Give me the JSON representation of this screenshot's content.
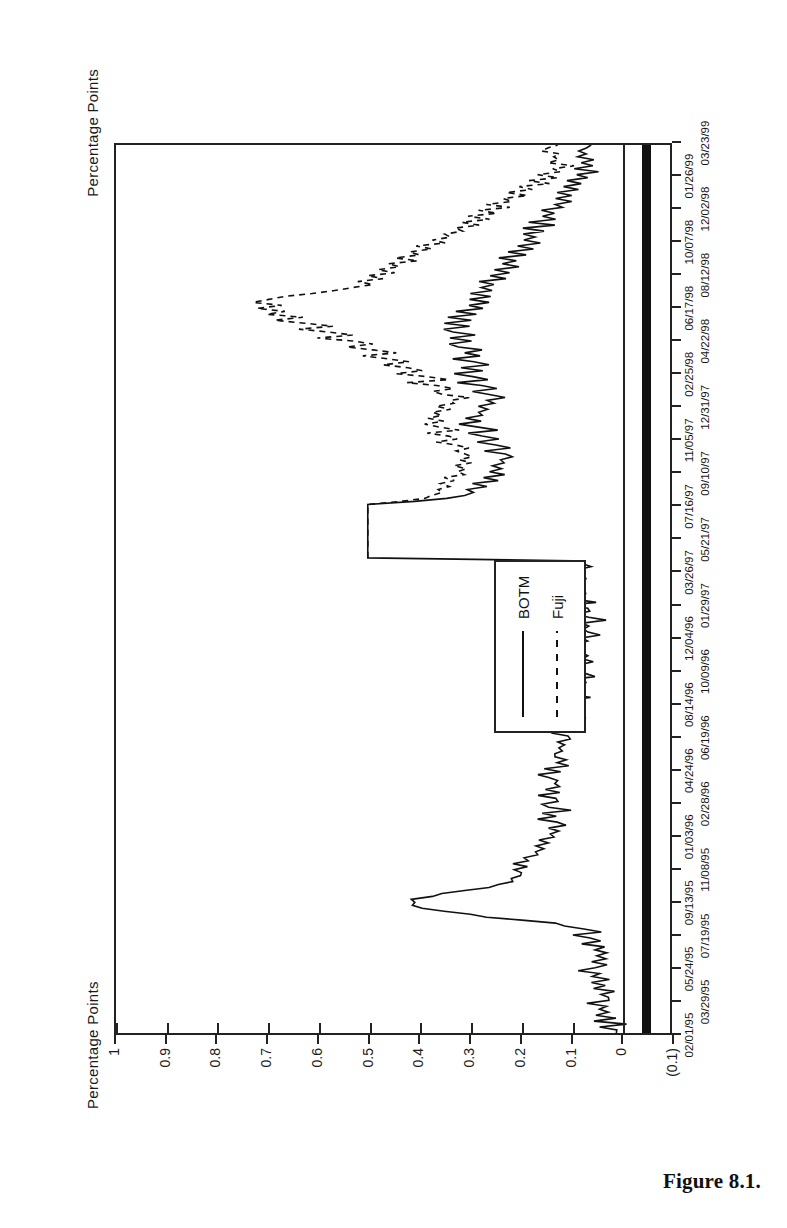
{
  "figure": {
    "caption": "Figure 8.1.",
    "axis_title_top": "Percentage Points",
    "axis_title_bottom": "Percentage Points"
  },
  "legend": {
    "items": [
      {
        "label": "BOTM",
        "style": "solid",
        "key_name": "legend-key-solid"
      },
      {
        "label": "Fuji",
        "style": "dashed",
        "key_name": "legend-key-dashed"
      }
    ]
  },
  "chart_data": {
    "type": "line",
    "title": "Percentage Points",
    "xlabel": "",
    "ylabel": "Percentage Points",
    "grid": false,
    "legend_position": "inside-left",
    "ylim": [
      -0.1,
      1.0
    ],
    "yticks": [
      1,
      0.9,
      0.8,
      0.7,
      0.6,
      0.5,
      0.4,
      0.3,
      0.2,
      0.1,
      0,
      -0.1
    ],
    "ytick_labels": [
      "1",
      "0.9",
      "0.8",
      "0.7",
      "0.6",
      "0.5",
      "0.4",
      "0.3",
      "0.2",
      "0.1",
      "0",
      "(0.1)"
    ],
    "xtick_labels_row1": [
      "02/01/95",
      "09/13/95",
      "04/24/96",
      "12/04/96",
      "07/16/97",
      "02/25/98",
      "10/07/98"
    ],
    "xtick_labels_row2": [
      "03/29/95",
      "11/08/95",
      "06/19/96",
      "01/29/97",
      "09/10/97",
      "04/22/98",
      "12/02/98"
    ],
    "xtick_labels_all": [
      "02/01/95",
      "03/29/95",
      "05/24/95",
      "07/19/95",
      "09/13/95",
      "11/08/95",
      "01/03/96",
      "02/28/96",
      "04/24/96",
      "06/19/96",
      "08/14/96",
      "10/09/96",
      "12/04/96",
      "01/29/97",
      "03/26/97",
      "05/21/97",
      "07/16/97",
      "09/10/97",
      "11/05/97",
      "12/31/97",
      "02/25/98",
      "04/22/98",
      "06/17/98",
      "08/12/98",
      "10/07/98",
      "12/02/98",
      "01/26/99",
      "03/23/99"
    ],
    "x_start": "02/01/95",
    "x_end": "03/23/99",
    "series": [
      {
        "name": "BOTM",
        "style": "solid",
        "values": [
          0.02,
          0.01,
          0.03,
          0.0,
          0.04,
          0.02,
          0.05,
          0.01,
          0.03,
          0.02,
          0.06,
          0.03,
          0.02,
          0.05,
          0.01,
          0.04,
          0.03,
          0.06,
          0.02,
          0.05,
          0.03,
          0.07,
          0.04,
          0.02,
          0.06,
          0.03,
          0.05,
          0.02,
          0.06,
          0.04,
          0.07,
          0.03,
          0.05,
          0.08,
          0.04,
          0.06,
          0.1,
          0.14,
          0.2,
          0.26,
          0.31,
          0.35,
          0.38,
          0.4,
          0.41,
          0.4,
          0.38,
          0.35,
          0.31,
          0.27,
          0.24,
          0.22,
          0.21,
          0.2,
          0.19,
          0.21,
          0.18,
          0.2,
          0.17,
          0.19,
          0.16,
          0.18,
          0.15,
          0.17,
          0.14,
          0.16,
          0.13,
          0.15,
          0.12,
          0.14,
          0.11,
          0.13,
          0.15,
          0.12,
          0.14,
          0.11,
          0.13,
          0.16,
          0.12,
          0.14,
          0.17,
          0.13,
          0.15,
          0.12,
          0.14,
          0.11,
          0.13,
          0.16,
          0.12,
          0.15,
          0.11,
          0.13,
          0.1,
          0.12,
          0.14,
          0.11,
          0.13,
          0.1,
          0.12,
          0.09,
          0.11,
          0.13,
          0.1,
          0.12,
          0.09,
          0.11,
          0.08,
          0.1,
          0.12,
          0.09,
          0.11,
          0.08,
          0.1,
          0.07,
          0.09,
          0.11,
          0.08,
          0.1,
          0.07,
          0.09,
          0.06,
          0.08,
          0.1,
          0.07,
          0.09,
          0.06,
          0.08,
          0.05,
          0.07,
          0.09,
          0.06,
          0.08,
          0.05,
          0.07,
          0.04,
          0.06,
          0.08,
          0.05,
          0.07,
          0.04,
          0.06,
          0.09,
          0.05,
          0.07,
          0.1,
          0.06,
          0.08,
          0.11,
          0.07,
          0.09,
          0.12,
          0.08,
          0.1,
          0.07,
          0.09,
          0.06,
          0.08,
          0.05,
          0.07,
          0.09,
          0.5,
          0.5,
          0.5,
          0.5,
          0.5,
          0.5,
          0.5,
          0.5,
          0.5,
          0.5,
          0.5,
          0.5,
          0.5,
          0.5,
          0.5,
          0.5,
          0.5,
          0.5,
          0.5,
          0.42,
          0.33,
          0.3,
          0.28,
          0.31,
          0.27,
          0.29,
          0.25,
          0.27,
          0.24,
          0.26,
          0.23,
          0.25,
          0.22,
          0.24,
          0.21,
          0.23,
          0.26,
          0.22,
          0.24,
          0.28,
          0.23,
          0.26,
          0.3,
          0.25,
          0.28,
          0.32,
          0.27,
          0.3,
          0.26,
          0.29,
          0.25,
          0.28,
          0.24,
          0.27,
          0.23,
          0.26,
          0.29,
          0.24,
          0.27,
          0.31,
          0.26,
          0.29,
          0.33,
          0.28,
          0.31,
          0.27,
          0.3,
          0.34,
          0.29,
          0.32,
          0.28,
          0.31,
          0.35,
          0.3,
          0.33,
          0.29,
          0.32,
          0.36,
          0.31,
          0.34,
          0.3,
          0.33,
          0.29,
          0.32,
          0.28,
          0.31,
          0.27,
          0.3,
          0.26,
          0.29,
          0.25,
          0.28,
          0.24,
          0.27,
          0.23,
          0.26,
          0.22,
          0.25,
          0.21,
          0.24,
          0.2,
          0.23,
          0.19,
          0.22,
          0.18,
          0.21,
          0.17,
          0.2,
          0.16,
          0.19,
          0.15,
          0.18,
          0.14,
          0.17,
          0.13,
          0.16,
          0.12,
          0.15,
          0.11,
          0.14,
          0.1,
          0.13,
          0.09,
          0.12,
          0.08,
          0.11,
          0.07,
          0.1,
          0.06,
          0.09,
          0.05,
          0.08,
          0.04,
          0.07,
          0.05,
          0.08,
          0.06,
          0.09,
          0.07,
          0.05
        ]
      },
      {
        "name": "Fuji",
        "style": "dashed",
        "values": [
          null,
          null,
          null,
          null,
          null,
          null,
          null,
          null,
          null,
          null,
          null,
          null,
          null,
          null,
          null,
          null,
          null,
          null,
          null,
          null,
          null,
          null,
          null,
          null,
          null,
          null,
          null,
          null,
          null,
          null,
          null,
          null,
          null,
          null,
          null,
          null,
          null,
          null,
          null,
          null,
          null,
          null,
          null,
          null,
          null,
          null,
          null,
          null,
          null,
          null,
          null,
          null,
          null,
          null,
          null,
          null,
          null,
          null,
          null,
          null,
          null,
          null,
          null,
          null,
          null,
          null,
          null,
          null,
          null,
          null,
          null,
          null,
          null,
          null,
          null,
          null,
          null,
          null,
          null,
          null,
          null,
          null,
          null,
          null,
          null,
          null,
          null,
          null,
          null,
          null,
          null,
          null,
          null,
          null,
          null,
          null,
          null,
          null,
          null,
          null,
          null,
          null,
          null,
          null,
          null,
          null,
          null,
          null,
          null,
          null,
          null,
          null,
          null,
          null,
          null,
          null,
          null,
          null,
          null,
          null,
          null,
          null,
          null,
          null,
          null,
          null,
          null,
          null,
          null,
          null,
          null,
          null,
          null,
          null,
          null,
          null,
          null,
          null,
          null,
          null,
          null,
          null,
          null,
          null,
          null,
          null,
          null,
          null,
          null,
          null,
          null,
          null,
          null,
          null,
          null,
          null,
          null,
          null,
          null,
          null,
          0.5,
          0.5,
          0.5,
          0.5,
          0.5,
          0.5,
          0.5,
          0.5,
          0.5,
          0.5,
          0.5,
          0.5,
          0.5,
          0.5,
          0.5,
          0.5,
          0.5,
          0.5,
          0.5,
          0.44,
          0.38,
          0.36,
          0.34,
          0.37,
          0.33,
          0.35,
          0.32,
          0.34,
          0.31,
          0.33,
          0.3,
          0.32,
          0.29,
          0.31,
          0.28,
          0.3,
          0.33,
          0.29,
          0.32,
          0.36,
          0.31,
          0.34,
          0.38,
          0.33,
          0.36,
          0.4,
          0.35,
          0.38,
          0.34,
          0.37,
          0.33,
          0.36,
          0.32,
          0.35,
          0.31,
          0.34,
          0.38,
          0.33,
          0.36,
          0.41,
          0.35,
          0.39,
          0.44,
          0.38,
          0.42,
          0.47,
          0.41,
          0.45,
          0.51,
          0.45,
          0.49,
          0.55,
          0.49,
          0.53,
          0.59,
          0.53,
          0.57,
          0.64,
          0.58,
          0.62,
          0.68,
          0.63,
          0.7,
          0.66,
          0.72,
          0.68,
          0.74,
          0.7,
          0.66,
          0.62,
          0.57,
          0.53,
          0.49,
          0.52,
          0.47,
          0.5,
          0.45,
          0.48,
          0.43,
          0.46,
          0.41,
          0.44,
          0.39,
          0.42,
          0.37,
          0.4,
          0.35,
          0.38,
          0.33,
          0.36,
          0.31,
          0.34,
          0.29,
          0.32,
          0.27,
          0.3,
          0.25,
          0.28,
          0.23,
          0.26,
          0.21,
          0.24,
          0.19,
          0.22,
          0.17,
          0.2,
          0.15,
          0.18,
          0.13,
          0.16,
          0.11,
          0.14,
          0.1,
          0.13,
          0.11,
          0.14,
          0.12,
          0.15,
          0.13,
          0.11
        ]
      }
    ]
  }
}
